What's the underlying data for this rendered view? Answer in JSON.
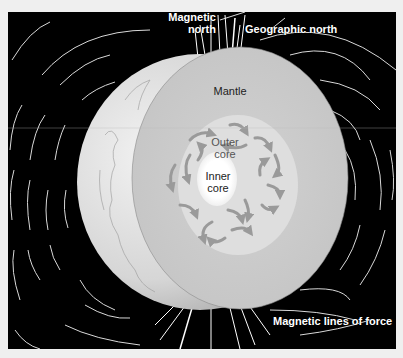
{
  "figure": {
    "background_color": "#000000",
    "labels": {
      "magnetic_north": [
        "Magnetic",
        "north"
      ],
      "geographic_north": "Geographic north",
      "mantle": "Mantle",
      "outer_core": [
        "Outer",
        "core"
      ],
      "inner_core": [
        "Inner",
        "core"
      ],
      "field_lines": "Magnetic lines of force"
    },
    "colors": {
      "mantle": "#c9c9c9",
      "outer_core": "#dedede",
      "inner_core": "#ffffff",
      "convection_arrows": "#9a9a9a",
      "field_lines": "#ffffff",
      "globe_surface": "#d8d8d8"
    }
  }
}
